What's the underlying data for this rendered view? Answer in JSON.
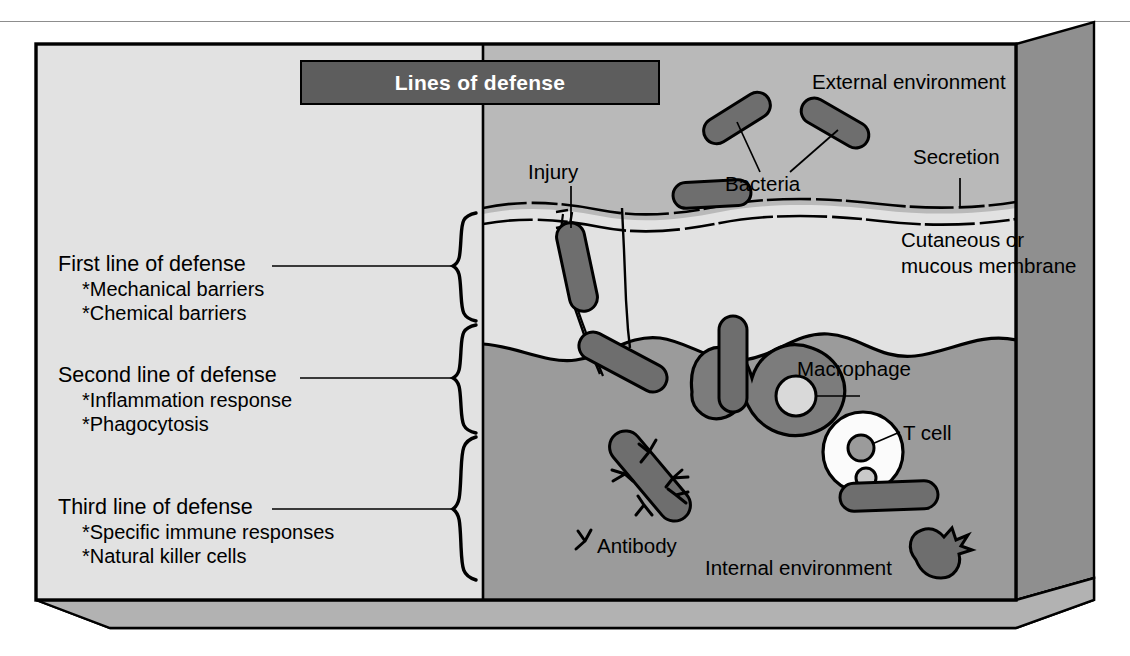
{
  "figure": {
    "title": "Lines of defense",
    "type": "biology-diagram"
  },
  "colors": {
    "panel_left": "#e2e2e2",
    "external_environment": "#b9b9b9",
    "membrane_layer": "#e0e0e0",
    "internal_environment": "#9b9b9b",
    "slab_side": "#8f8f8f",
    "slab_bottom": "#b2b2b2",
    "cell_fill": "#6e6e6e",
    "macrophage_fill": "#7c7c7c",
    "tcell_fill": "#fbfbfb",
    "title_bar_bg": "#5d5d5d",
    "title_bar_text": "#ffffff",
    "outline": "#000000"
  },
  "defense_lines": [
    {
      "id": "first",
      "heading": "First line of defense",
      "items": [
        "*Mechanical barriers",
        "*Chemical barriers"
      ]
    },
    {
      "id": "second",
      "heading": "Second line of defense",
      "items": [
        "*Inflammation response",
        "*Phagocytosis"
      ]
    },
    {
      "id": "third",
      "heading": "Third line of defense",
      "items": [
        "*Specific immune responses",
        "*Natural killer cells"
      ]
    }
  ],
  "callouts": {
    "external_environment": "External environment",
    "internal_environment": "Internal environment",
    "secretion": "Secretion",
    "cutaneous_membrane_line1": "Cutaneous or",
    "cutaneous_membrane_line2": "mucous membrane",
    "injury": "Injury",
    "bacteria": "Bacteria",
    "macrophage": "Macrophage",
    "t_cell": "T cell",
    "antibody": "Antibody"
  }
}
